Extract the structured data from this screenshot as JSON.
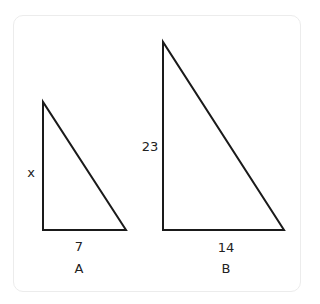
{
  "triangles": [
    {
      "name": "A",
      "label": "A",
      "side_vertical": "x",
      "side_horizontal": "7",
      "points": "43,102 43,230 126,230"
    },
    {
      "name": "B",
      "label": "B",
      "side_vertical": "23",
      "side_horizontal": "14",
      "points": "163,42 163,230 284,230"
    }
  ],
  "colors": {
    "stroke": "#1a1a1a",
    "frame": "#ececec"
  }
}
